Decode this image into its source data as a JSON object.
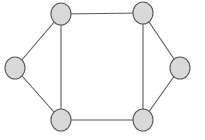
{
  "diagram": {
    "type": "undirected-graph",
    "style": {
      "background": "#ffffff",
      "node_fill": "#d9d9d9",
      "node_stroke": "#5a5a5a",
      "edge_color": "#5a5a5a",
      "node_rx": 10,
      "node_ry": 11
    },
    "nodes": [
      {
        "id": "top-left",
        "x": 61,
        "y": 14
      },
      {
        "id": "top-right",
        "x": 143,
        "y": 13
      },
      {
        "id": "left",
        "x": 15,
        "y": 68
      },
      {
        "id": "right",
        "x": 180,
        "y": 68
      },
      {
        "id": "bottom-left",
        "x": 61,
        "y": 120
      },
      {
        "id": "bottom-right",
        "x": 143,
        "y": 120
      }
    ],
    "edges": [
      {
        "from": "top-left",
        "to": "top-right"
      },
      {
        "from": "top-left",
        "to": "left"
      },
      {
        "from": "top-left",
        "to": "bottom-left"
      },
      {
        "from": "left",
        "to": "bottom-left"
      },
      {
        "from": "bottom-left",
        "to": "bottom-right"
      },
      {
        "from": "top-right",
        "to": "bottom-right"
      },
      {
        "from": "top-right",
        "to": "right"
      },
      {
        "from": "right",
        "to": "bottom-right"
      }
    ]
  }
}
